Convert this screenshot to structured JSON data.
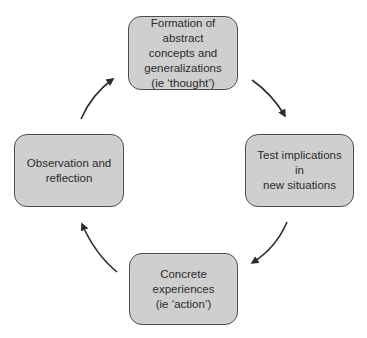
{
  "diagram": {
    "type": "cycle",
    "nodes": [
      {
        "id": "top",
        "label": "Formation of abstract\nconcepts and\ngeneralizations\n(ie ‘thought’)"
      },
      {
        "id": "right",
        "label": "Test implications in\nnew situations"
      },
      {
        "id": "bottom",
        "label": "Concrete experiences\n(ie ‘action’)"
      },
      {
        "id": "left",
        "label": "Observation and\nreflection"
      }
    ],
    "edges": [
      {
        "from": "top",
        "to": "right",
        "direction": "clockwise"
      },
      {
        "from": "right",
        "to": "bottom",
        "direction": "clockwise"
      },
      {
        "from": "bottom",
        "to": "left",
        "direction": "clockwise"
      },
      {
        "from": "left",
        "to": "top",
        "direction": "clockwise"
      }
    ],
    "colors": {
      "node_fill": "#cfcfcf",
      "node_border": "#4a4a4a",
      "arrow": "#2b2b2b",
      "text": "#2b2b2b",
      "background": "#ffffff"
    }
  }
}
